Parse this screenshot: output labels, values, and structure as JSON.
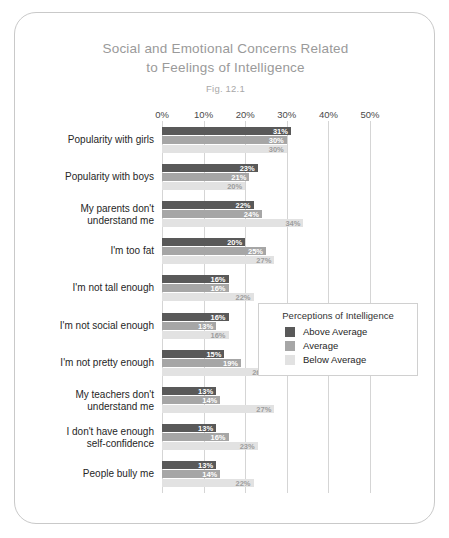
{
  "figure": {
    "title_line1": "Social and Emotional Concerns Related",
    "title_line2": "to Feelings of Intelligence",
    "fig_number": "Fig. 12.1"
  },
  "legend": {
    "title": "Perceptions of Intelligence",
    "items": [
      {
        "label": "Above Average",
        "color": "#595959"
      },
      {
        "label": "Average",
        "color": "#a6a6a6"
      },
      {
        "label": "Below Average",
        "color": "#e2e2e2"
      }
    ]
  },
  "chart_data": {
    "type": "bar",
    "orientation": "horizontal",
    "title": "Social and Emotional Concerns Related to Feelings of Intelligence",
    "subtitle": "Fig. 12.1",
    "xlabel": "",
    "ylabel": "",
    "xlim": [
      0,
      50
    ],
    "xticks": [
      0,
      10,
      20,
      30,
      40,
      50
    ],
    "xtick_labels": [
      "0%",
      "10%",
      "20%",
      "30%",
      "40%",
      "50%"
    ],
    "grid": true,
    "legend_position": "middle-right",
    "value_suffix": "%",
    "categories": [
      "Popularity with girls",
      "Popularity with boys",
      "My parents don't\nunderstand me",
      "I'm too fat",
      "I'm not tall enough",
      "I'm not social enough",
      "I'm not pretty enough",
      "My teachers don't\nunderstand me",
      "I don't have enough\nself-confidence",
      "People bully me"
    ],
    "series": [
      {
        "name": "Above Average",
        "color": "#595959",
        "values": [
          31,
          23,
          22,
          20,
          16,
          16,
          15,
          13,
          13,
          13
        ],
        "labels": [
          "31%",
          "23%",
          "22%",
          "20%",
          "16%",
          "16%",
          "15%",
          "13%",
          "13%",
          "13%"
        ]
      },
      {
        "name": "Average",
        "color": "#a6a6a6",
        "values": [
          30,
          21,
          24,
          25,
          16,
          13,
          19,
          14,
          16,
          14
        ],
        "labels": [
          "30%",
          "21%",
          "24%",
          "25%",
          "16%",
          "13%",
          "19%",
          "14%",
          "16%",
          "14%"
        ]
      },
      {
        "name": "Below Average",
        "color": "#e2e2e2",
        "values": [
          30,
          20,
          34,
          27,
          22,
          16,
          26,
          27,
          23,
          22
        ],
        "labels": [
          "30%",
          "20%",
          "34%",
          "27%",
          "22%",
          "16%",
          "26%",
          "27%",
          "23%",
          "22%"
        ]
      }
    ]
  }
}
